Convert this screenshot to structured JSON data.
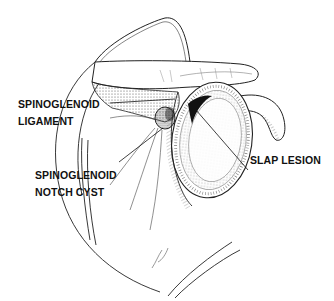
{
  "figure": {
    "labels": {
      "spinoglenoid_ligament": {
        "line1": "SPINOGLENOID",
        "line2": "LIGAMENT"
      },
      "spinoglenoid_notch_cyst": {
        "line1": "SPINOGLENOID",
        "line2": "NOTCH CYST"
      },
      "slap_lesion": {
        "line1": "SLAP LESION"
      }
    },
    "colors": {
      "ink": "#111111",
      "background": "#ffffff"
    }
  }
}
